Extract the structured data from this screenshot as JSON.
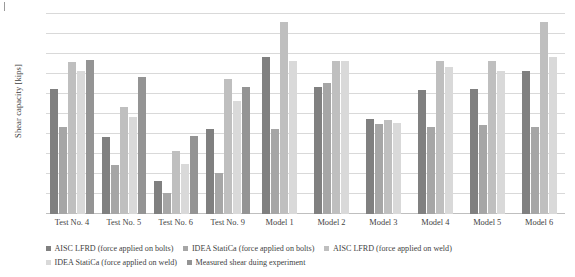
{
  "chart_data": {
    "type": "bar",
    "title": "",
    "xlabel": "",
    "ylabel": "Shear capacity [kips]",
    "ylim": [
      0,
      300
    ],
    "ytick_step": 30,
    "yticks": [
      0,
      30,
      60,
      90,
      120,
      150,
      180,
      210,
      240,
      270,
      300
    ],
    "grid": true,
    "legend_position": "bottom",
    "categories": [
      "Test No. 4",
      "Test No. 5",
      "Test No. 6",
      "Test No. 9",
      "Model 1",
      "Model 2",
      "Model 3",
      "Model 4",
      "Model 5",
      "Model 6"
    ],
    "series": [
      {
        "name": "AISC LFRD (force applied on bolts)",
        "color": "#808080",
        "values": [
          187,
          115,
          49,
          127,
          235,
          191,
          143,
          186,
          187,
          215
        ]
      },
      {
        "name": "IDEA StatiCa (force applied on bolts)",
        "color": "#a6a6a6",
        "values": [
          130,
          73,
          31,
          61,
          127,
          196,
          135,
          130,
          133,
          130
        ]
      },
      {
        "name": "AISC LFRD (force applied on weld)",
        "color": "#bfbfbf",
        "values": [
          228,
          161,
          95,
          203,
          288,
          230,
          141,
          230,
          230,
          288
        ]
      },
      {
        "name": "IDEA StatiCa (force applied on weld)",
        "color": "#d9d9d9",
        "values": [
          215,
          146,
          75,
          170,
          230,
          230,
          137,
          220,
          215,
          235
        ]
      },
      {
        "name": "Measured shear duing experiment",
        "color": "#949494",
        "values": [
          231,
          205,
          117,
          190,
          null,
          null,
          null,
          null,
          null,
          null
        ]
      }
    ]
  }
}
